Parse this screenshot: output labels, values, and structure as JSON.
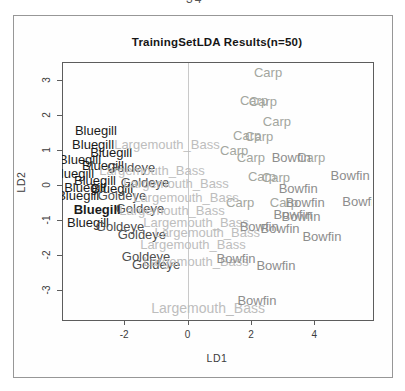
{
  "page": {
    "page_number_partial": "34"
  },
  "colors": {
    "Bluegill": "#1b1b1b",
    "Goldeye": "#4e4e4e",
    "Largemouth_Bass": "#bdbdbd",
    "Carp": "#a3a69e",
    "Bowfin": "#8d8d8d",
    "axis": "#5d5d5d",
    "grid": "#c9c9c9",
    "figure_border": "#979797"
  },
  "chart_data": {
    "type": "scatter",
    "title": "TrainingSetLDA Results(n=50)",
    "xlabel": "LD1",
    "ylabel": "LD2",
    "xlim": [
      -3.96,
      5.82
    ],
    "ylim": [
      -3.83,
      3.51
    ],
    "x_ticks": [
      -2,
      0,
      2,
      4
    ],
    "y_ticks": [
      -3,
      -2,
      -1,
      0,
      1,
      2,
      3
    ],
    "grid": "single vertical reference line at x=0",
    "legend": "none (points drawn as class-name text labels)",
    "series": [
      {
        "name": "Carp",
        "color": "#a3a69e",
        "points": [
          {
            "x": 2.54,
            "y": 3.2
          },
          {
            "x": 2.1,
            "y": 2.4
          },
          {
            "x": 2.38,
            "y": 2.37
          },
          {
            "x": 2.82,
            "y": 1.8
          },
          {
            "x": 1.88,
            "y": 1.4
          },
          {
            "x": 2.26,
            "y": 1.37
          },
          {
            "x": 1.47,
            "y": 0.97
          },
          {
            "x": 2.0,
            "y": 0.77
          },
          {
            "x": 3.9,
            "y": 0.77
          },
          {
            "x": 2.35,
            "y": 0.23
          },
          {
            "x": 2.79,
            "y": 0.2
          },
          {
            "x": 1.66,
            "y": -0.51
          },
          {
            "x": 3.04,
            "y": -0.51
          }
        ]
      },
      {
        "name": "Bluegill",
        "color": "#1b1b1b",
        "points": [
          {
            "x": -2.89,
            "y": 1.54
          },
          {
            "x": -2.98,
            "y": 1.14
          },
          {
            "x": -2.41,
            "y": 0.91
          },
          {
            "x": -3.39,
            "y": 0.71
          },
          {
            "x": -2.67,
            "y": 0.54
          },
          {
            "x": -3.61,
            "y": 0.31
          },
          {
            "x": -2.92,
            "y": 0.11
          },
          {
            "x": -3.23,
            "y": -0.09
          },
          {
            "x": -2.38,
            "y": -0.11
          },
          {
            "x": -3.45,
            "y": -0.31
          },
          {
            "x": -2.85,
            "y": -0.71,
            "bold": true
          },
          {
            "x": -3.14,
            "y": -1.09
          }
        ]
      },
      {
        "name": "Goldeye",
        "color": "#4e4e4e",
        "points": [
          {
            "x": -1.78,
            "y": 0.49
          },
          {
            "x": -1.34,
            "y": 0.06
          },
          {
            "x": -2.07,
            "y": -0.31
          },
          {
            "x": -1.5,
            "y": -0.69
          },
          {
            "x": -2.13,
            "y": -1.2
          },
          {
            "x": -1.44,
            "y": -1.43
          },
          {
            "x": -1.31,
            "y": -2.06
          },
          {
            "x": -0.99,
            "y": -2.29
          }
        ]
      },
      {
        "name": "Largemouth_Bass",
        "color": "#bdbdbd",
        "points": [
          {
            "x": -0.65,
            "y": 1.14
          },
          {
            "x": -1.12,
            "y": 0.4
          },
          {
            "x": -0.36,
            "y": 0.03
          },
          {
            "x": -0.05,
            "y": -0.37
          },
          {
            "x": -0.49,
            "y": -0.74
          },
          {
            "x": 0.27,
            "y": -1.09
          },
          {
            "x": 0.62,
            "y": -1.37
          },
          {
            "x": 0.17,
            "y": -1.71
          },
          {
            "x": 0.27,
            "y": -2.2
          },
          {
            "x": 0.65,
            "y": -3.54,
            "size": 14
          }
        ]
      },
      {
        "name": "Bowfin",
        "color": "#8d8d8d",
        "points": [
          {
            "x": 3.27,
            "y": 0.77
          },
          {
            "x": 5.13,
            "y": 0.26
          },
          {
            "x": 3.49,
            "y": -0.11
          },
          {
            "x": 3.71,
            "y": -0.51
          },
          {
            "x": 5.5,
            "y": -0.49
          },
          {
            "x": 3.33,
            "y": -0.86
          },
          {
            "x": 3.58,
            "y": -0.91
          },
          {
            "x": 2.26,
            "y": -1.2
          },
          {
            "x": 2.92,
            "y": -1.26
          },
          {
            "x": 4.24,
            "y": -1.49
          },
          {
            "x": 1.53,
            "y": -2.11
          },
          {
            "x": 2.79,
            "y": -2.31
          },
          {
            "x": 2.19,
            "y": -3.31
          }
        ]
      }
    ]
  }
}
